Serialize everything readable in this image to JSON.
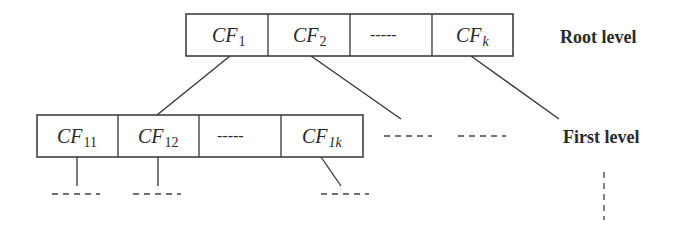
{
  "diagram": {
    "root_level": {
      "label": "Root level",
      "cells": [
        {
          "main": "CF",
          "sub": "1"
        },
        {
          "main": "CF",
          "sub": "2"
        },
        {
          "main": "-----",
          "sub": ""
        },
        {
          "main": "CF",
          "sub": "k"
        }
      ]
    },
    "first_level": {
      "label": "First level",
      "cells": [
        {
          "main": "CF",
          "sub": "11"
        },
        {
          "main": "CF",
          "sub": "12"
        },
        {
          "main": "-----",
          "sub": ""
        },
        {
          "main": "CF",
          "sub": "1k"
        }
      ]
    }
  }
}
